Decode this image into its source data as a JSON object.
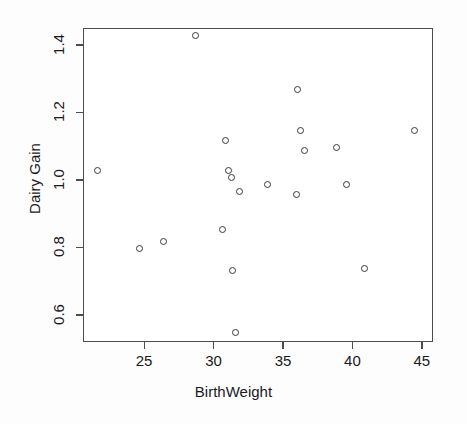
{
  "chart_data": {
    "type": "scatter",
    "title": "",
    "xlabel": "BirthWeight",
    "ylabel": "Dairy Gain",
    "xlim": [
      20.6,
      45.8
    ],
    "ylim": [
      0.52,
      1.45
    ],
    "xticks": [
      25,
      30,
      35,
      40,
      45
    ],
    "yticks": [
      0.6,
      0.8,
      1.0,
      1.2,
      1.4
    ],
    "xtick_labels": [
      "25",
      "30",
      "35",
      "40",
      "45"
    ],
    "ytick_labels": [
      "0.6",
      "0.8",
      "1.0",
      "1.2",
      "1.4"
    ],
    "grid": false,
    "legend": null,
    "marker": "open-circle",
    "marker_color": "#3a3a3a",
    "n_points": 21,
    "points": [
      {
        "x": 21.6,
        "y": 1.03
      },
      {
        "x": 24.6,
        "y": 0.8
      },
      {
        "x": 26.3,
        "y": 0.82
      },
      {
        "x": 28.6,
        "y": 1.43
      },
      {
        "x": 30.6,
        "y": 0.855
      },
      {
        "x": 30.8,
        "y": 1.12
      },
      {
        "x": 31.0,
        "y": 1.03
      },
      {
        "x": 31.2,
        "y": 1.01
      },
      {
        "x": 31.3,
        "y": 0.735
      },
      {
        "x": 31.5,
        "y": 0.55
      },
      {
        "x": 31.8,
        "y": 0.97
      },
      {
        "x": 33.8,
        "y": 0.99
      },
      {
        "x": 35.9,
        "y": 0.96
      },
      {
        "x": 36.0,
        "y": 1.27
      },
      {
        "x": 36.2,
        "y": 1.15
      },
      {
        "x": 36.5,
        "y": 1.09
      },
      {
        "x": 38.8,
        "y": 1.1
      },
      {
        "x": 39.5,
        "y": 0.99
      },
      {
        "x": 40.8,
        "y": 0.74
      },
      {
        "x": 44.4,
        "y": 1.15
      }
    ]
  }
}
